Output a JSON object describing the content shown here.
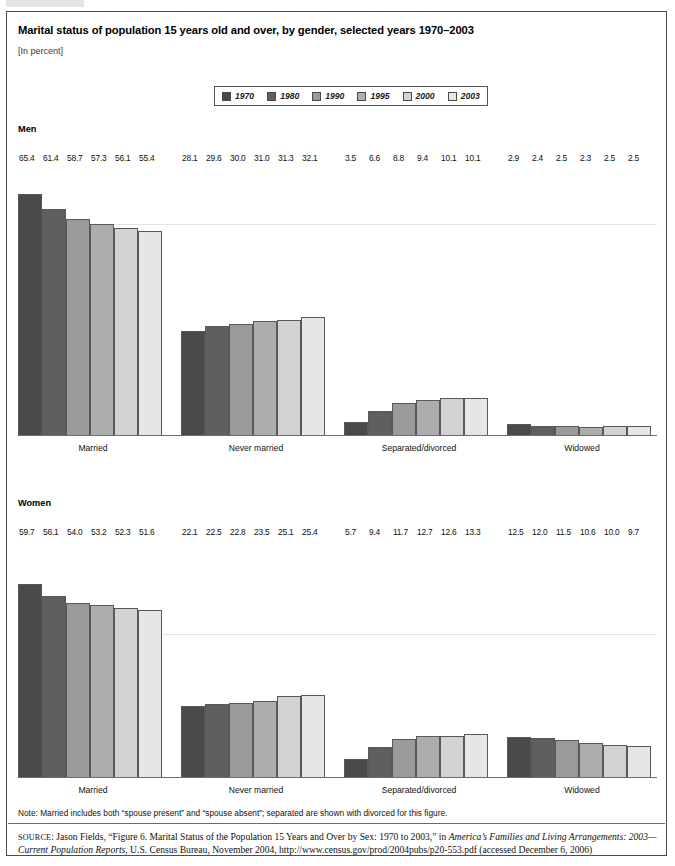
{
  "figure": {
    "title": "Marital status of population 15 years old and over, by gender, selected years 1970–2003",
    "subtitle": "[In percent]",
    "note": "Note:  Married includes both “spouse present” and “spouse absent”; separated are shown with divorced for this figure.",
    "source_prefix": "SOURCE",
    "source_part1": ": Jason Fields, “Figure 6. Marital Status of the Population 15 Years and Over by Sex: 1970 to 2003,” in ",
    "source_italic1": "America’s Families and Living Arrangements: 2003—Current Population Reports",
    "source_part2": ", U.S. Census Bureau, November 2004, http://www.census.gov/prod/2004pubs/p20-553.pdf (accessed December 6, 2006)"
  },
  "legend": {
    "items": [
      {
        "label": "1970",
        "color": "#4a4a4a"
      },
      {
        "label": "1980",
        "color": "#5f5f5f"
      },
      {
        "label": "1990",
        "color": "#9a9a9a"
      },
      {
        "label": "1995",
        "color": "#adadad"
      },
      {
        "label": "2000",
        "color": "#d2d2d2"
      },
      {
        "label": "2003",
        "color": "#e6e6e6"
      }
    ]
  },
  "panels": {
    "men_label": "Men",
    "women_label": "Women"
  },
  "chart_data": {
    "type": "bar",
    "title": "Marital status of population 15 years old and over, by gender, selected years 1970–2003",
    "subtitle": "[In percent]",
    "xlabel": "",
    "ylabel": "Percent",
    "ylim": [
      0,
      70
    ],
    "grid": false,
    "legend_position": "top-center",
    "series_names": [
      "1970",
      "1980",
      "1990",
      "1995",
      "2000",
      "2003"
    ],
    "series_colors": [
      "#4a4a4a",
      "#5f5f5f",
      "#9a9a9a",
      "#adadad",
      "#d2d2d2",
      "#e6e6e6"
    ],
    "panels": [
      {
        "name": "Men",
        "categories": [
          "Married",
          "Never married",
          "Separated/divorced",
          "Widowed"
        ],
        "series": [
          {
            "name": "1970",
            "values": [
              65.4,
              28.1,
              3.5,
              2.9
            ]
          },
          {
            "name": "1980",
            "values": [
              61.4,
              29.6,
              6.6,
              2.4
            ]
          },
          {
            "name": "1990",
            "values": [
              58.7,
              30.0,
              8.8,
              2.5
            ]
          },
          {
            "name": "1995",
            "values": [
              57.3,
              31.0,
              9.4,
              2.3
            ]
          },
          {
            "name": "2000",
            "values": [
              56.1,
              31.3,
              10.1,
              2.5
            ]
          },
          {
            "name": "2003",
            "values": [
              55.4,
              32.1,
              10.1,
              2.5
            ]
          }
        ]
      },
      {
        "name": "Women",
        "categories": [
          "Married",
          "Never married",
          "Separated/divorced",
          "Widowed"
        ],
        "series": [
          {
            "name": "1970",
            "values": [
              59.7,
              22.1,
              5.7,
              12.5
            ]
          },
          {
            "name": "1980",
            "values": [
              56.1,
              22.5,
              9.4,
              12.0
            ]
          },
          {
            "name": "1990",
            "values": [
              54.0,
              22.8,
              11.7,
              11.5
            ]
          },
          {
            "name": "1995",
            "values": [
              53.2,
              23.5,
              12.7,
              10.6
            ]
          },
          {
            "name": "2000",
            "values": [
              52.3,
              25.1,
              12.6,
              10.0
            ]
          },
          {
            "name": "2003",
            "values": [
              51.6,
              25.4,
              13.3,
              9.7
            ]
          }
        ]
      }
    ]
  }
}
